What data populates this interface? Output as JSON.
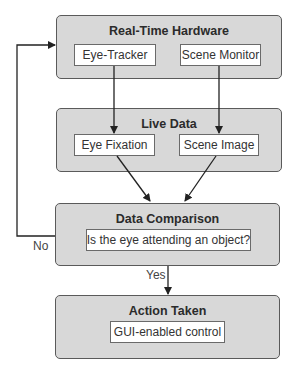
{
  "diagram": {
    "type": "flowchart",
    "colors": {
      "group_fill": "#d8d8d8",
      "group_border": "#5a5a5a",
      "node_fill": "#ffffff",
      "line": "#222222"
    },
    "groups": [
      {
        "id": "real_time_hardware",
        "title": "Real-Time Hardware",
        "nodes": [
          "Eye-Tracker",
          "Scene Monitor"
        ]
      },
      {
        "id": "live_data",
        "title": "Live Data",
        "nodes": [
          "Eye Fixation",
          "Scene Image"
        ]
      },
      {
        "id": "data_comparison",
        "title": "Data Comparison",
        "nodes": [
          "Is the eye attending an object?"
        ]
      },
      {
        "id": "action_taken",
        "title": "Action Taken",
        "nodes": [
          "GUI-enabled control"
        ]
      }
    ],
    "edges": [
      {
        "from": "Eye-Tracker",
        "to": "Eye Fixation",
        "label": ""
      },
      {
        "from": "Scene Monitor",
        "to": "Scene Image",
        "label": ""
      },
      {
        "from": "Eye Fixation",
        "to": "Data Comparison",
        "label": ""
      },
      {
        "from": "Scene Image",
        "to": "Data Comparison",
        "label": ""
      },
      {
        "from": "Data Comparison",
        "to": "Action Taken",
        "label": "Yes"
      },
      {
        "from": "Data Comparison",
        "to": "Real-Time Hardware",
        "label": "No"
      }
    ],
    "labels": {
      "yes": "Yes",
      "no": "No"
    }
  }
}
